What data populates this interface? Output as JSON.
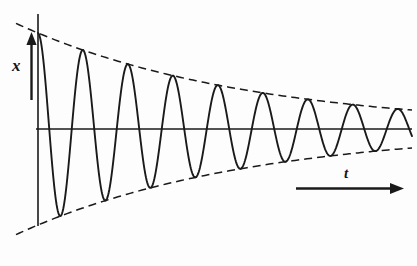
{
  "figure": {
    "background_color": "#fdfdfd",
    "stroke_color": "#1a1a1a"
  },
  "labels": {
    "vertical_axis": "x",
    "horizontal_axis": "t"
  },
  "icons": {
    "x_axis_arrow": "arrow-up-icon",
    "t_axis_arrow": "arrow-right-icon"
  },
  "chart_data": {
    "type": "line",
    "xlabel": "t",
    "ylabel": "x",
    "grid": false,
    "legend_position": "none",
    "axes": {
      "vertical_axis_x_px": 38,
      "zero_line_y_px": 129,
      "vertical_axis_top_px": 14,
      "vertical_axis_bottom_px": 226,
      "zero_line_start_px": 36,
      "zero_line_end_px": 412
    },
    "model": {
      "equation": "x(t) = A0 * exp(-t / tau) * cos(2*pi*t / T)",
      "amplitude_initial_px": 96,
      "amplitude_final_px": 12,
      "decay_constant_px": 230,
      "period_px": 45,
      "phase": "cosine starts at positive maximum",
      "x_start_px": 38,
      "x_end_px": 412
    },
    "envelope": {
      "style": "dashed",
      "dash_pattern": [
        8,
        5
      ],
      "upper_start_y_px": 33,
      "upper_end_y_px": 117,
      "lower_start_y_px": 225,
      "lower_end_y_px": 141,
      "upper_extends_left_of_axis": true,
      "lower_extends_left_of_axis": true
    },
    "series": [
      {
        "name": "damped oscillation",
        "style": "solid",
        "peaks_x_px": [
          38,
          105,
          150,
          195,
          240,
          285,
          330,
          375
        ],
        "peaks_y_px": [
          33,
          57,
          71,
          82,
          92,
          100,
          107,
          112
        ],
        "troughs_x_px": [
          60,
          128,
          173,
          218,
          262,
          307,
          352,
          397
        ],
        "troughs_y_px": [
          205,
          190,
          179,
          171,
          164,
          158,
          152,
          147
        ]
      }
    ]
  }
}
